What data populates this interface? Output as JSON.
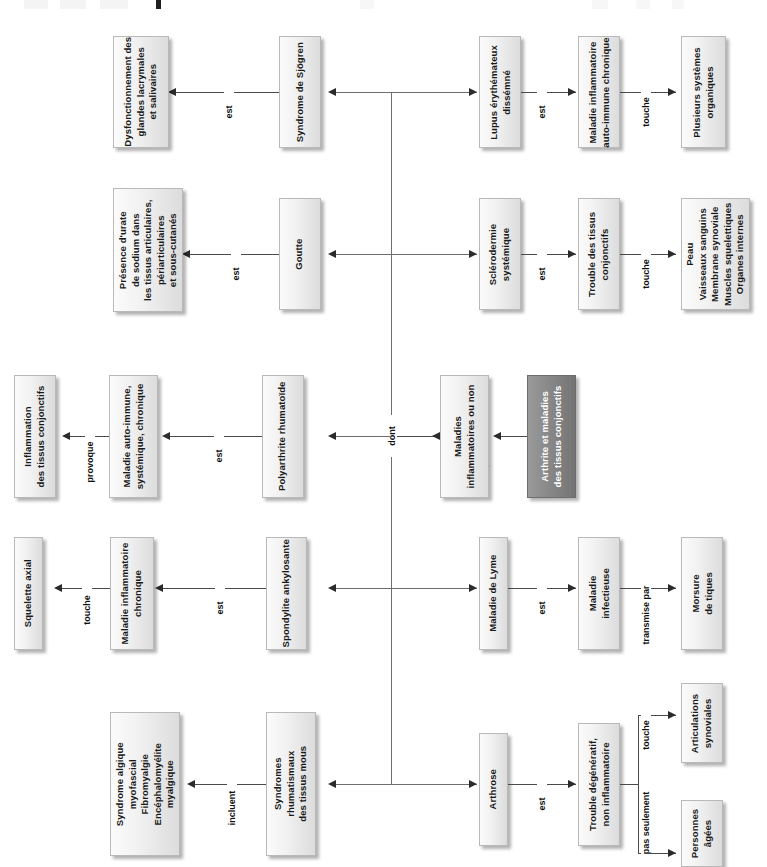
{
  "diagram": {
    "language": "fr",
    "orientation": "text rotated 90 degrees counter-clockwise",
    "colors": {
      "node_fill": "#eeeeee",
      "node_border": "#b9b9b9",
      "root_fill": "#828282",
      "root_text": "#ffffff",
      "line": "#4a4a4a",
      "text": "#1a1a1a"
    },
    "root": {
      "label": "Arthrite et maladies\ndes tissus conjonctifs"
    },
    "hub": {
      "label": "Maladies\ninflammatoires ou non",
      "edge_to_hub": "comprennent",
      "branch_label": "dont"
    },
    "rows": [
      {
        "id": "row-sjogren",
        "left_chain": {
          "outcome": "Dysfonctionnement des\nglandes lacrymales\net salivaires",
          "edge": "est",
          "disease": "Syndrome de Sjögren"
        },
        "right_chain": {
          "disease": "Lupus érythémateux\ndissémné",
          "edge1": "est",
          "middle": "Maladie inflammatoire\nauto-immune chronique",
          "edge2": "touche",
          "outcome": "Plusieurs systèmes\norganiques"
        }
      },
      {
        "id": "row-goutte",
        "left_chain": {
          "outcome": "Présence d'urate\nde sodium dans\nles tissus articulaires,\npériarticulaires\net sous-cutanés",
          "edge": "est",
          "disease": "Goutte"
        },
        "right_chain": {
          "disease": "Sclérodermie\nsystémique",
          "edge1": "est",
          "middle": "Trouble des tissus\nconjonctifs",
          "edge2": "touche",
          "outcome": "Peau\nVaisseaux sanguins\nMembrane synoviale\nMuscles squelettiques\nOrganes internes"
        }
      },
      {
        "id": "row-polyarthrite",
        "left_chain": {
          "outcome": "Inflammation\ndes tissus conjonctifs",
          "edge_outcome": "provoque",
          "middle": "Maladie auto-immune,\nsystémique, chronique",
          "edge": "est",
          "disease": "Polyarthrite rhumatoïde"
        }
      },
      {
        "id": "row-spondylite",
        "left_chain": {
          "outcome": "Squelette axial",
          "edge_outcome": "touche",
          "middle": "Maladie inflammatoire\nchronique",
          "edge": "est",
          "disease": "Spondylite ankylosante"
        },
        "right_chain": {
          "disease": "Maladie de Lyme",
          "edge1": "est",
          "middle": "Maladie\ninfectieuse",
          "edge2": "transmise par",
          "outcome": "Morsure\nde tiques"
        }
      },
      {
        "id": "row-arthrose",
        "left_chain": {
          "outcome": "Syndrome algique\nmyofascial\nFibromyalgie\nEncéphalomyélite\nmyalgique",
          "edge": "incluent",
          "disease": "Syndromes\nrhumatismaux\ndes tissus mous"
        },
        "right_chain": {
          "disease": "Arthrose",
          "edge1": "est",
          "middle": "Trouble dégénératif,\nnon inflammatoire",
          "edge2": "touche",
          "outcome": "Articulations\nsynoviales",
          "edge3": "pas seulement",
          "outcome2": "Personnes\nâgées"
        }
      }
    ]
  }
}
